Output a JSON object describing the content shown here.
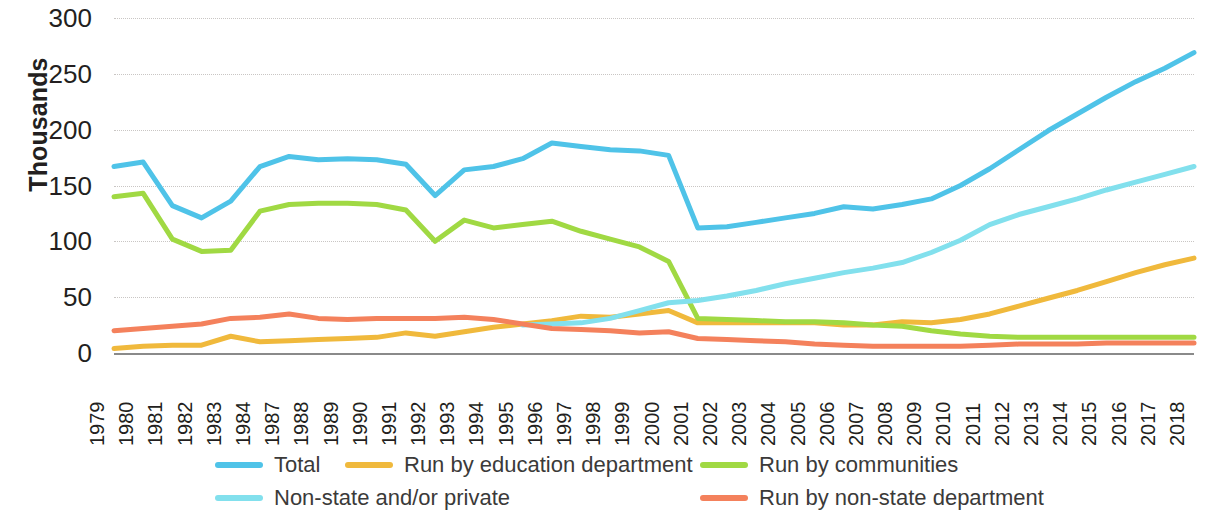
{
  "chart_data": {
    "type": "line",
    "title": "",
    "xlabel": "",
    "ylabel": "Thousands",
    "ylim": [
      0,
      300
    ],
    "ytick_values": [
      0,
      50,
      100,
      150,
      200,
      250,
      300
    ],
    "ytick_labels": [
      "0",
      "50",
      "100",
      "150",
      "200",
      "250",
      "300"
    ],
    "grid": true,
    "legend_position": "bottom",
    "categories": [
      "1979",
      "1980",
      "1981",
      "1982",
      "1983",
      "1984",
      "1987",
      "1988",
      "1989",
      "1990",
      "1991",
      "1992",
      "1993",
      "1994",
      "1995",
      "1996",
      "1997",
      "1998",
      "1999",
      "2000",
      "2001",
      "2002",
      "2003",
      "2004",
      "2005",
      "2006",
      "2007",
      "2008",
      "2009",
      "2010",
      "2011",
      "2012",
      "2013",
      "2014",
      "2015",
      "2016",
      "2017",
      "2018"
    ],
    "series": [
      {
        "name": "Total",
        "color": "#4FC3E8",
        "values": [
          167,
          171,
          132,
          121,
          136,
          167,
          176,
          173,
          174,
          173,
          169,
          141,
          164,
          167,
          174,
          188,
          185,
          182,
          181,
          177,
          112,
          113,
          117,
          121,
          125,
          131,
          129,
          133,
          138,
          150,
          165,
          182,
          199,
          214,
          229,
          243,
          255,
          269
        ]
      },
      {
        "name": "Run by education department",
        "color": "#F0B93C",
        "values": [
          4,
          6,
          7,
          7,
          15,
          10,
          11,
          12,
          13,
          14,
          18,
          15,
          19,
          23,
          26,
          29,
          33,
          32,
          35,
          38,
          27,
          27,
          27,
          27,
          27,
          25,
          25,
          28,
          27,
          30,
          35,
          42,
          49,
          56,
          64,
          72,
          79,
          85
        ]
      },
      {
        "name": "Run by communities",
        "color": "#A0D943",
        "values": [
          140,
          143,
          102,
          91,
          92,
          127,
          133,
          134,
          134,
          133,
          128,
          100,
          119,
          112,
          115,
          118,
          109,
          102,
          95,
          82,
          31,
          30,
          29,
          28,
          28,
          27,
          25,
          24,
          20,
          17,
          15,
          14,
          14,
          14,
          14,
          14,
          14,
          14
        ]
      },
      {
        "name": "Non-state and/or private",
        "color": "#82E0ED",
        "values": [
          null,
          null,
          null,
          null,
          null,
          null,
          null,
          null,
          null,
          null,
          null,
          null,
          null,
          null,
          25,
          26,
          27,
          31,
          38,
          45,
          47,
          51,
          56,
          62,
          67,
          72,
          76,
          81,
          90,
          101,
          115,
          124,
          131,
          138,
          146,
          153,
          160,
          167
        ]
      },
      {
        "name": "Run by non-state department",
        "color": "#F4815C",
        "values": [
          20,
          22,
          24,
          26,
          31,
          32,
          35,
          31,
          30,
          31,
          31,
          31,
          32,
          30,
          26,
          22,
          21,
          20,
          18,
          19,
          13,
          12,
          11,
          10,
          8,
          7,
          6,
          6,
          6,
          6,
          7,
          8,
          8,
          8,
          9,
          9,
          9,
          9
        ]
      }
    ]
  },
  "legend": {
    "items": [
      {
        "label": "Total",
        "color": "#4FC3E8"
      },
      {
        "label": "Run by education department",
        "color": "#F0B93C"
      },
      {
        "label": "Run by communities",
        "color": "#A0D943"
      },
      {
        "label": "Non-state and/or private",
        "color": "#82E0ED"
      },
      {
        "label": "Run by non-state department",
        "color": "#F4815C"
      }
    ]
  }
}
